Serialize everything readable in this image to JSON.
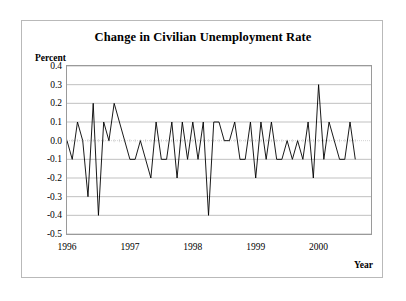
{
  "figure": {
    "title": "Change in Civilian Unemployment Rate",
    "y_axis_title": "Percent",
    "x_axis_title": "Year"
  },
  "colors": {
    "line": "#000000",
    "gridline": "#a6a6a6",
    "zero_line": "#bfbfbf",
    "plot_border": "#9a9a9a",
    "figure_border": "#b9b9b9",
    "background": "#ffffff",
    "text": "#000000"
  },
  "chart_data": {
    "type": "line",
    "title": "Change in Civilian Unemployment Rate",
    "xlabel": "Year",
    "ylabel": "Percent",
    "ylim": [
      -0.5,
      0.4
    ],
    "xlim": [
      1996.0,
      11996.0
    ],
    "grid": true,
    "legend": null,
    "y_ticks": [
      "0.4",
      "0.3",
      "0.2",
      "0.1",
      "0.0",
      "-0.1",
      "-0.2",
      "-0.3",
      "-0.4",
      "-0.5"
    ],
    "y_tick_values": [
      0.4,
      0.3,
      0.2,
      0.1,
      0.0,
      -0.1,
      -0.2,
      -0.3,
      -0.4,
      -0.5
    ],
    "x_ticks": [
      "1996",
      "1997",
      "1998",
      "1999",
      "2000"
    ],
    "x_tick_values": [
      1996,
      1997,
      1998,
      1999,
      2000
    ],
    "x_start": 1996.0,
    "x_step": 0.08333333,
    "series": [
      {
        "name": "Change in Civilian Unemployment Rate",
        "values": [
          0.0,
          -0.1,
          0.1,
          0.0,
          -0.3,
          0.2,
          -0.4,
          0.1,
          0.0,
          0.2,
          0.1,
          0.0,
          -0.1,
          -0.1,
          0.0,
          -0.1,
          -0.2,
          0.1,
          -0.1,
          -0.1,
          0.1,
          -0.2,
          0.1,
          -0.1,
          0.1,
          -0.1,
          0.1,
          -0.4,
          0.1,
          0.1,
          0.0,
          0.0,
          0.1,
          -0.1,
          -0.1,
          0.1,
          -0.2,
          0.1,
          -0.1,
          0.1,
          -0.1,
          -0.1,
          0.0,
          -0.1,
          0.0,
          -0.1,
          0.1,
          -0.2,
          0.3,
          -0.1,
          0.1,
          0.0,
          -0.1,
          -0.1,
          0.1,
          -0.1
        ]
      }
    ]
  }
}
